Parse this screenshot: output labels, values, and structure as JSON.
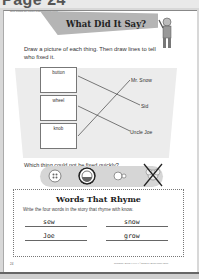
{
  "header": {
    "partial_title": "Page 24",
    "skills_line": "Skills: Reading Skill Context Reading Rhyming Words"
  },
  "activity": {
    "title": "What Did It Say?",
    "instructions": "Draw a picture of each thing. Then draw lines to tell who fixed it.",
    "things": [
      {
        "label": "button"
      },
      {
        "label": "wheel"
      },
      {
        "label": "knob"
      }
    ],
    "people": [
      {
        "name": "Mr. Snow"
      },
      {
        "name": "Sid"
      },
      {
        "name": "Uncle Joe"
      }
    ],
    "matches": [
      {
        "thing": "button",
        "person": "Sid"
      },
      {
        "thing": "wheel",
        "person": "Uncle Joe"
      },
      {
        "thing": "knob",
        "person": "Mr. Snow"
      }
    ]
  },
  "question": {
    "prefix": "Which thing could ",
    "emphasis": "not",
    "suffix": " be fixed quickly?",
    "options": [
      {
        "icon": "button-icon",
        "selected": false,
        "crossed": false
      },
      {
        "icon": "wheel-icon",
        "selected": true,
        "crossed": false
      },
      {
        "icon": "knob-icon",
        "selected": false,
        "crossed": false
      },
      {
        "icon": "flower-icon",
        "selected": false,
        "crossed": true
      }
    ]
  },
  "rhyme": {
    "title": "Words That Rhyme",
    "instructions": "Write the four words in the story that rhyme with know.",
    "answers": [
      "sew",
      "snow",
      "Joe",
      "grow"
    ]
  },
  "footer": {
    "page_number": "24",
    "credit": "Reading • EMC XXXX • ©2003 by Evan-Moor Corp."
  }
}
